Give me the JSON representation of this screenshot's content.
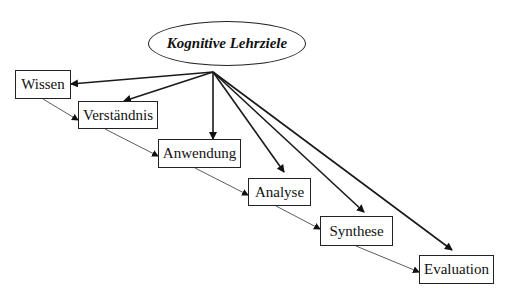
{
  "diagram": {
    "root": {
      "label": "Kognitive Lehrziele"
    },
    "levels": [
      {
        "label": "Wissen"
      },
      {
        "label": "Verständnis"
      },
      {
        "label": "Anwendung"
      },
      {
        "label": "Analyse"
      },
      {
        "label": "Synthese"
      },
      {
        "label": "Evaluation"
      }
    ],
    "edges": {
      "from_root": [
        "Wissen",
        "Verständnis",
        "Anwendung",
        "Analyse",
        "Synthese",
        "Evaluation"
      ],
      "sequence": [
        [
          "Wissen",
          "Verständnis"
        ],
        [
          "Verständnis",
          "Anwendung"
        ],
        [
          "Anwendung",
          "Analyse"
        ],
        [
          "Analyse",
          "Synthese"
        ],
        [
          "Synthese",
          "Evaluation"
        ]
      ]
    }
  }
}
